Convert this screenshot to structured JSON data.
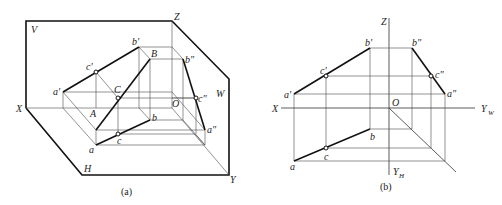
{
  "figure_a": {
    "caption": "(a)",
    "planes": {
      "V": "V",
      "H": "H",
      "W": "W"
    },
    "axes": {
      "X": "X",
      "Y": "Y",
      "Z": "Z",
      "O": "O"
    },
    "points_3d": {
      "A": "A",
      "B": "B",
      "C": "C"
    },
    "projections_v": {
      "a": "a'",
      "b": "b'",
      "c": "c'"
    },
    "projections_h": {
      "a": "a",
      "b": "b",
      "c": "c"
    },
    "projections_w": {
      "a": "a\"",
      "b": "b\"",
      "c": "c\""
    }
  },
  "figure_b": {
    "caption": "(b)",
    "axes": {
      "X": "X",
      "Z": "Z",
      "O": "O",
      "YW": "Y",
      "YW_sub": "W",
      "YH": "Y",
      "YH_sub": "H"
    },
    "projections_v": {
      "a": "a'",
      "b": "b'",
      "c": "c'"
    },
    "projections_h": {
      "a": "a",
      "b": "b",
      "c": "c"
    },
    "projections_w": {
      "a": "a\"",
      "b": "b\"",
      "c": "c\""
    }
  }
}
